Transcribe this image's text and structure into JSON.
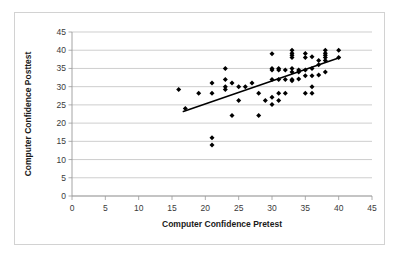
{
  "figure": {
    "background_color": "#ffffff",
    "border_color": "#d2d2d2"
  },
  "chart_data": {
    "type": "scatter",
    "title": "",
    "xlabel": "Computer Confidence Pretest",
    "ylabel": "Computer Confidence Posttest",
    "xlim": [
      0,
      45
    ],
    "ylim": [
      0,
      45
    ],
    "xticks": [
      0,
      5,
      10,
      15,
      20,
      25,
      30,
      35,
      40,
      45
    ],
    "yticks": [
      0,
      5,
      10,
      15,
      20,
      25,
      30,
      35,
      40,
      45
    ],
    "grid": "horizontal",
    "legend": "none",
    "marker_color": "#000000",
    "marker_shape": "diamond",
    "trendline": {
      "present": true,
      "color": "#000000",
      "x_start": 16.7,
      "y_start": 23.2,
      "x_end": 40.2,
      "y_end": 38.0
    },
    "points": [
      [
        16,
        29.2
      ],
      [
        17,
        24.0
      ],
      [
        19,
        28.2
      ],
      [
        21,
        31.0
      ],
      [
        21,
        28.2
      ],
      [
        21,
        16.0
      ],
      [
        21,
        14.0
      ],
      [
        23,
        35.0
      ],
      [
        23,
        32.0
      ],
      [
        23,
        30.0
      ],
      [
        23,
        29.2
      ],
      [
        24,
        31.0
      ],
      [
        24,
        22.1
      ],
      [
        25,
        30.0
      ],
      [
        25,
        26.2
      ],
      [
        26,
        30.0
      ],
      [
        27,
        31.0
      ],
      [
        28,
        28.2
      ],
      [
        28,
        22.1
      ],
      [
        29,
        26.2
      ],
      [
        30,
        39.0
      ],
      [
        30,
        35.0
      ],
      [
        30,
        34.6
      ],
      [
        30,
        32.0
      ],
      [
        30,
        27.1
      ],
      [
        30,
        25.1
      ],
      [
        31,
        35.0
      ],
      [
        31,
        34.6
      ],
      [
        31,
        32.0
      ],
      [
        31,
        28.2
      ],
      [
        31,
        26.2
      ],
      [
        32,
        34.6
      ],
      [
        32,
        32.0
      ],
      [
        32,
        28.2
      ],
      [
        33,
        40.0
      ],
      [
        33,
        39.2
      ],
      [
        33,
        38.6
      ],
      [
        33,
        38.0
      ],
      [
        33,
        35.0
      ],
      [
        33,
        34.0
      ],
      [
        33,
        32.0
      ],
      [
        33,
        31.6
      ],
      [
        34,
        34.6
      ],
      [
        34,
        34.0
      ],
      [
        34,
        32.1
      ],
      [
        35,
        39.1
      ],
      [
        35,
        38.0
      ],
      [
        35,
        34.6
      ],
      [
        35,
        33.0
      ],
      [
        35,
        28.2
      ],
      [
        36,
        38.2
      ],
      [
        36,
        35.0
      ],
      [
        36,
        33.0
      ],
      [
        36,
        30.0
      ],
      [
        36,
        28.2
      ],
      [
        37,
        37.2
      ],
      [
        37,
        36.0
      ],
      [
        37,
        33.2
      ],
      [
        38,
        40.0
      ],
      [
        38,
        39.2
      ],
      [
        38,
        38.6
      ],
      [
        38,
        38.0
      ],
      [
        38,
        37.2
      ],
      [
        38,
        34.0
      ],
      [
        40,
        40.0
      ],
      [
        40,
        38.0
      ]
    ]
  }
}
